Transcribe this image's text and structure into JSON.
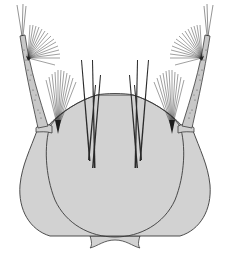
{
  "figure": {
    "colors": {
      "background": "#ffffff",
      "capsule_fill": "#d2d2d2",
      "outline": "#3a3a3a",
      "seta": "#2a2a2a",
      "antenna_fill": "#c8c8c8"
    },
    "parts": [
      {
        "name": "head-capsule"
      },
      {
        "name": "frontoclypeus"
      },
      {
        "name": "left-antenna"
      },
      {
        "name": "right-antenna"
      },
      {
        "name": "left-antennal-seta-tuft"
      },
      {
        "name": "right-antennal-seta-tuft"
      },
      {
        "name": "left-lateral-seta-tuft"
      },
      {
        "name": "right-lateral-seta-tuft"
      },
      {
        "name": "frontal-setae"
      },
      {
        "name": "labrum"
      }
    ]
  }
}
